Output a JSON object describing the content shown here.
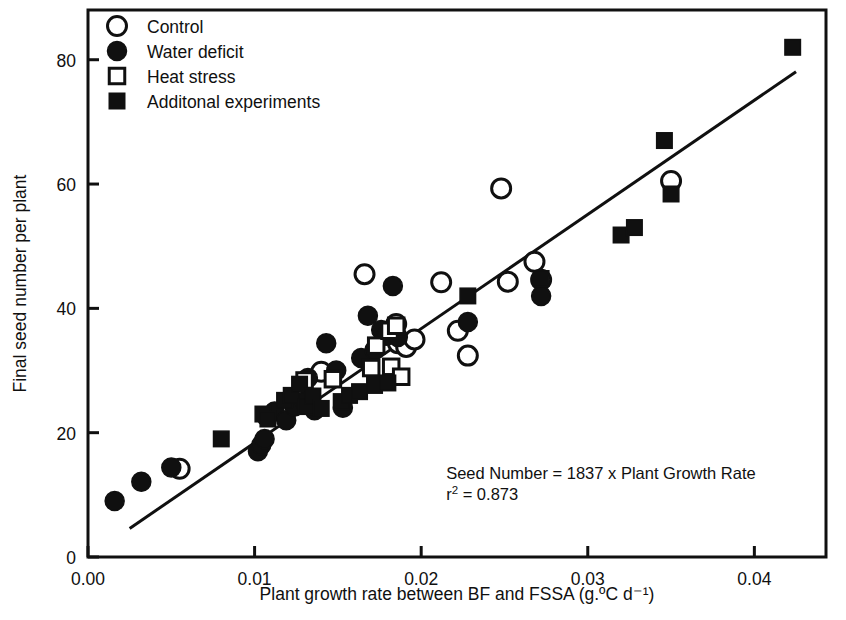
{
  "figure": {
    "background": "#ffffff",
    "ink": "#101010"
  },
  "chart_data": {
    "type": "scatter",
    "title": "",
    "xlabel": "Plant growth rate between BF and FSSA (g.ºC d⁻¹)",
    "ylabel": "Final seed number per plant",
    "xlim": [
      0.0,
      0.0443
    ],
    "ylim": [
      0,
      88
    ],
    "grid": false,
    "xticks": [
      0.0,
      0.01,
      0.02,
      0.03,
      0.04
    ],
    "xtick_labels": [
      "0.00",
      "0.01",
      "0.02",
      "0.03",
      "0.04"
    ],
    "yticks": [
      0,
      20,
      40,
      60,
      80
    ],
    "ytick_labels": [
      "0",
      "20",
      "40",
      "60",
      "80"
    ],
    "legend_position": "top-left",
    "legend": [
      {
        "label": "Control",
        "marker": "open-circle"
      },
      {
        "label": "Water deficit",
        "marker": "filled-circle"
      },
      {
        "label": "Heat stress",
        "marker": "open-square"
      },
      {
        "label": "Additonal experiments",
        "marker": "filled-square"
      }
    ],
    "annotations": [
      {
        "text": "Seed Number = 1837 x Plant Growth Rate",
        "x": 0.0215,
        "y": 12.5
      },
      {
        "text": "r² = 0.873",
        "x": 0.0215,
        "y": 9.2
      }
    ],
    "fit_line": {
      "equation": "Seed Number = 1837 x Plant Growth Rate",
      "slope": 1837,
      "intercept": 0,
      "r_squared": 0.873,
      "x_start": 0.0025,
      "x_end": 0.0425
    },
    "series": [
      {
        "name": "Control",
        "marker": "open-circle",
        "points": [
          [
            0.0055,
            14.2
          ],
          [
            0.014,
            29.8
          ],
          [
            0.0166,
            45.5
          ],
          [
            0.018,
            36.0
          ],
          [
            0.0185,
            37.5
          ],
          [
            0.0186,
            34.4
          ],
          [
            0.0191,
            33.8
          ],
          [
            0.0196,
            35.0
          ],
          [
            0.0212,
            44.2
          ],
          [
            0.0222,
            36.4
          ],
          [
            0.0228,
            32.4
          ],
          [
            0.0248,
            59.3
          ],
          [
            0.0252,
            44.3
          ],
          [
            0.0268,
            47.5
          ],
          [
            0.0272,
            44.6
          ],
          [
            0.035,
            60.5
          ]
        ]
      },
      {
        "name": "Water deficit",
        "marker": "filled-circle",
        "points": [
          [
            0.0016,
            9.0
          ],
          [
            0.0032,
            12.1
          ],
          [
            0.005,
            14.4
          ],
          [
            0.0102,
            17.0
          ],
          [
            0.0104,
            18.0
          ],
          [
            0.0106,
            19.0
          ],
          [
            0.0107,
            22.6
          ],
          [
            0.0112,
            23.4
          ],
          [
            0.0119,
            22.0
          ],
          [
            0.0124,
            24.2
          ],
          [
            0.013,
            25.0
          ],
          [
            0.0132,
            28.8
          ],
          [
            0.0136,
            23.6
          ],
          [
            0.0143,
            34.4
          ],
          [
            0.0149,
            30.0
          ],
          [
            0.0153,
            24.0
          ],
          [
            0.0164,
            32.0
          ],
          [
            0.0168,
            38.8
          ],
          [
            0.0172,
            33.3
          ],
          [
            0.0176,
            36.5
          ],
          [
            0.0179,
            35.6
          ],
          [
            0.0183,
            43.6
          ],
          [
            0.0186,
            35.4
          ],
          [
            0.0228,
            37.8
          ],
          [
            0.0272,
            42.0
          ]
        ]
      },
      {
        "name": "Heat stress",
        "marker": "open-square",
        "points": [
          [
            0.013,
            28.4
          ],
          [
            0.0147,
            28.6
          ],
          [
            0.017,
            30.4
          ],
          [
            0.0173,
            34.0
          ],
          [
            0.0181,
            36.4
          ],
          [
            0.0182,
            30.6
          ],
          [
            0.0185,
            37.2
          ],
          [
            0.0188,
            29.0
          ]
        ]
      },
      {
        "name": "Additonal experiments",
        "marker": "filled-square",
        "points": [
          [
            0.008,
            19.0
          ],
          [
            0.0105,
            23.0
          ],
          [
            0.0108,
            22.2
          ],
          [
            0.0118,
            25.2
          ],
          [
            0.0122,
            26.0
          ],
          [
            0.0127,
            27.8
          ],
          [
            0.0131,
            24.2
          ],
          [
            0.0135,
            25.9
          ],
          [
            0.014,
            23.9
          ],
          [
            0.0152,
            25.0
          ],
          [
            0.0157,
            26.0
          ],
          [
            0.0163,
            26.6
          ],
          [
            0.0172,
            27.6
          ],
          [
            0.018,
            28.0
          ],
          [
            0.0228,
            42.0
          ],
          [
            0.0272,
            44.8
          ],
          [
            0.032,
            51.8
          ],
          [
            0.0328,
            53.0
          ],
          [
            0.0346,
            67.0
          ],
          [
            0.035,
            58.4
          ],
          [
            0.0423,
            82.0
          ]
        ]
      }
    ]
  }
}
